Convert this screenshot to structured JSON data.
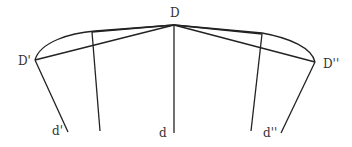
{
  "diagram": {
    "labels": {
      "D": "D",
      "D_prime": "D'",
      "D_double_prime": "D''",
      "d": "d",
      "d_prime": "d'",
      "d_double_prime": "d''"
    },
    "stroke_color": "#222222",
    "label_color": "#333333"
  }
}
